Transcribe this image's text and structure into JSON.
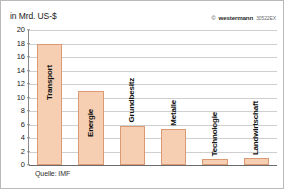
{
  "figure": {
    "unit_label": "in Mrd. US-$",
    "source_note": "Quelle: IMF"
  },
  "credit": {
    "copyright_mark": "©",
    "publisher": "westermann",
    "code": "30522EX"
  },
  "colors": {
    "bar_fill": "#f6cfb2",
    "bar_border": "#d99a74",
    "grid": "#cfcfcf",
    "axis": "#8a8a8a",
    "baseline": "#6b6b6b",
    "text": "#1a1a1a",
    "frame": "#b9b9b9",
    "background": "#ffffff"
  },
  "chart_data": {
    "type": "bar",
    "title": "",
    "subtitle": "",
    "xlabel": "",
    "ylabel": "in Mrd. US-$",
    "ylim": [
      0,
      20
    ],
    "yticks": [
      20,
      18,
      16,
      14,
      12,
      10,
      8,
      6,
      4,
      2,
      0
    ],
    "ytick_labels": [
      "20",
      "18",
      "16",
      "14",
      "12",
      "10",
      "8",
      "6",
      "4",
      "2",
      "0"
    ],
    "grid": true,
    "legend": false,
    "categories": [
      "Transport",
      "Energie",
      "Grundbesitz",
      "Metalle",
      "Technologie",
      "Landwirtschaft"
    ],
    "values": [
      18,
      11,
      5.8,
      5.4,
      0.9,
      1.0
    ],
    "labels_rotated": true,
    "source": "Quelle: IMF"
  }
}
